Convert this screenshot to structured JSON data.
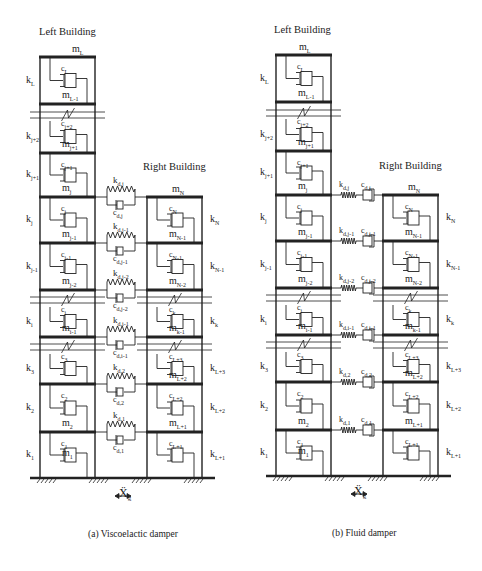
{
  "panels": [
    {
      "id": "a",
      "caption": "(a) Viscoelactic damper",
      "left_title": "Left Building",
      "right_title": "Right Building",
      "left_top_mass": "m_L",
      "right_top_mass": "m_N",
      "ground_excitation": "Ẍg",
      "damper_type": "viscoelastic (spring parallel with dashpot)"
    },
    {
      "id": "b",
      "caption": "(b) Fluid damper",
      "left_title": "Left Building",
      "right_title": "Right Building",
      "left_top_mass": "m_L",
      "right_top_mass": "m_N",
      "ground_excitation": "Ẍg",
      "damper_type": "fluid (spring in series with dashpot)"
    }
  ],
  "labels": {
    "left_building": "Left Building",
    "right_building": "Right Building",
    "mL": "m",
    "mL_sub": "L",
    "mN": "m",
    "mN_sub": "N",
    "xg": "Ẍ",
    "xg_sub": "g",
    "cap_a": "(a) Viscoelactic damper",
    "cap_b": "(b) Fluid damper"
  },
  "left_building": {
    "stiffness": [
      {
        "k": "k",
        "sub": "L"
      },
      {
        "k": "k",
        "sub": "j+2"
      },
      {
        "k": "k",
        "sub": "j+1"
      },
      {
        "k": "k",
        "sub": "j"
      },
      {
        "k": "k",
        "sub": "j-1"
      },
      {
        "k": "k",
        "sub": "i"
      },
      {
        "k": "k",
        "sub": "3"
      },
      {
        "k": "k",
        "sub": "2"
      },
      {
        "k": "k",
        "sub": "1"
      }
    ],
    "damping": [
      {
        "c": "c",
        "sub": "L"
      },
      {
        "c": "c",
        "sub": "j+2"
      },
      {
        "c": "c",
        "sub": "j+1"
      },
      {
        "c": "c",
        "sub": "j"
      },
      {
        "c": "c",
        "sub": "j-1"
      },
      {
        "c": "c",
        "sub": "i"
      },
      {
        "c": "c",
        "sub": "3"
      },
      {
        "c": "c",
        "sub": "2"
      },
      {
        "c": "c",
        "sub": "1"
      }
    ],
    "masses": [
      {
        "m": "m",
        "sub": "L-1"
      },
      {
        "m": "m",
        "sub": "j+1"
      },
      {
        "m": "m",
        "sub": "j"
      },
      {
        "m": "m",
        "sub": "j-1"
      },
      {
        "m": "m",
        "sub": "j-2"
      },
      {
        "m": "m",
        "sub": "i-1"
      },
      {
        "m": "m",
        "sub": "2"
      },
      {
        "m": "m",
        "sub": "1"
      }
    ]
  },
  "right_building": {
    "stiffness": [
      {
        "k": "k",
        "sub": "N"
      },
      {
        "k": "k",
        "sub": "N-1"
      },
      {
        "k": "k",
        "sub": "k"
      },
      {
        "k": "k",
        "sub": "L+3"
      },
      {
        "k": "k",
        "sub": "L+2"
      },
      {
        "k": "k",
        "sub": "L+1"
      }
    ],
    "damping": [
      {
        "c": "c",
        "sub": "N"
      },
      {
        "c": "c",
        "sub": "N-1"
      },
      {
        "c": "c",
        "sub": "k"
      },
      {
        "c": "c",
        "sub": "L+3"
      },
      {
        "c": "c",
        "sub": "L+2"
      },
      {
        "c": "c",
        "sub": "L+1"
      }
    ],
    "masses": [
      {
        "m": "m",
        "sub": "N-1"
      },
      {
        "m": "m",
        "sub": "N-2"
      },
      {
        "m": "m",
        "sub": "k-1"
      },
      {
        "m": "m",
        "sub": "L+2"
      },
      {
        "m": "m",
        "sub": "L+1"
      }
    ]
  },
  "dampers": [
    {
      "k": "k",
      "ksub": "d,j",
      "c": "c",
      "csub": "d,j"
    },
    {
      "k": "k",
      "ksub": "d,j-1",
      "c": "c",
      "csub": "d,j-1"
    },
    {
      "k": "k",
      "ksub": "d,j-2",
      "c": "c",
      "csub": "d,j-2"
    },
    {
      "k": "k",
      "ksub": "d,i-1",
      "c": "c",
      "csub": "d,i-1"
    },
    {
      "k": "k",
      "ksub": "d,2",
      "c": "c",
      "csub": "d,2"
    },
    {
      "k": "k",
      "ksub": "d,1",
      "c": "c",
      "csub": "d,1"
    }
  ]
}
